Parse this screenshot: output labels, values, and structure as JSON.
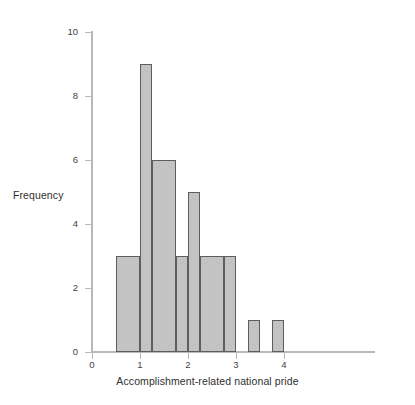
{
  "chart_data": {
    "type": "bar",
    "title": "",
    "xlabel": "Accomplishment-related national pride",
    "ylabel": "Frequency",
    "xlim": [
      0,
      4.4
    ],
    "ylim": [
      0,
      10
    ],
    "xticks": [
      0,
      1,
      2,
      3,
      4
    ],
    "xtick_labels": [
      "0",
      "1",
      "2",
      "3",
      "4"
    ],
    "yticks": [
      0,
      2,
      4,
      6,
      8,
      10
    ],
    "ytick_labels": [
      "0",
      "2",
      "4",
      "6",
      "8",
      "10"
    ],
    "grid": false,
    "legend": null,
    "bin_width": 0.5,
    "bars": [
      {
        "x0": 0.5,
        "x1": 1.0,
        "value": 3,
        "label": "3"
      },
      {
        "x0": 1.0,
        "x1": 1.25,
        "value": 9,
        "label": "9"
      },
      {
        "x0": 1.25,
        "x1": 1.75,
        "value": 6,
        "label": "6"
      },
      {
        "x0": 1.75,
        "x1": 2.0,
        "value": 3,
        "label": "3"
      },
      {
        "x0": 2.0,
        "x1": 2.25,
        "value": 5,
        "label": "5"
      },
      {
        "x0": 2.25,
        "x1": 2.75,
        "value": 3,
        "label": "3"
      },
      {
        "x0": 2.75,
        "x1": 3.0,
        "value": 3,
        "label": "3"
      },
      {
        "x0": 3.25,
        "x1": 3.5,
        "value": 1,
        "label": "1"
      },
      {
        "x0": 3.75,
        "x1": 4.0,
        "value": 1,
        "label": "1"
      }
    ],
    "bin_centers": [
      0.75,
      1.125,
      1.5,
      1.875,
      2.125,
      2.5,
      2.875,
      3.375,
      3.875
    ],
    "values": [
      3,
      9,
      6,
      3,
      5,
      3,
      3,
      1,
      1
    ],
    "total_count": 34,
    "colors": {
      "bar_fill": "#c3c3c3",
      "bar_edge": "#5e5e5e",
      "axis": "#b9b9b9",
      "text": "#2f2f2f",
      "background": "#ffffff"
    }
  }
}
